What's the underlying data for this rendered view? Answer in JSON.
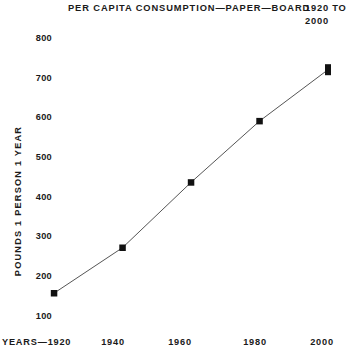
{
  "chart_data": {
    "type": "line",
    "title": "PER CAPITA CONSUMPTION—PAPER—BOARD",
    "title_range": "1920 TO 2000",
    "subtitle": "",
    "xlabel": "YEARS—1920",
    "ylabel": "POUNDS 1 PERSON 1 YEAR",
    "categories": [
      "1920",
      "1940",
      "1960",
      "1980",
      "2000"
    ],
    "x": [
      1920,
      1940,
      1960,
      1980,
      2000
    ],
    "values": [
      155,
      270,
      435,
      590,
      720
    ],
    "series": [
      {
        "name": "Per capita consumption",
        "values": [
          155,
          270,
          435,
          590,
          720
        ]
      }
    ],
    "xlim": [
      1920,
      2000
    ],
    "ylim": [
      100,
      800
    ],
    "ytick_labels": [
      "800",
      "700",
      "600",
      "500",
      "400",
      "300",
      "200",
      "100"
    ],
    "ytick_values": [
      800,
      700,
      600,
      500,
      400,
      300,
      200,
      100
    ],
    "xtick_labels": [
      "1940",
      "1960",
      "1980",
      "2000"
    ],
    "xtick_values": [
      1940,
      1960,
      1980,
      2000
    ],
    "grid": false,
    "legend": "none",
    "line_color": "#555555",
    "marker_color": "#111111",
    "marker": "square",
    "background": "#ffffff"
  },
  "chart": {
    "title_main": "PER CAPITA CONSUMPTION—PAPER—BOARD",
    "title_range_line1": "1920 TO",
    "title_range_line2": "2000",
    "y_axis_title": "POUNDS 1 PERSON 1 YEAR",
    "x_axis_first_label": "YEARS—1920",
    "y_ticks": [
      {
        "label": "800"
      },
      {
        "label": "700"
      },
      {
        "label": "600"
      },
      {
        "label": "500"
      },
      {
        "label": "400"
      },
      {
        "label": "300"
      },
      {
        "label": "200"
      },
      {
        "label": "100"
      }
    ],
    "x_ticks": [
      {
        "label": "1940"
      },
      {
        "label": "1960"
      },
      {
        "label": "1980"
      },
      {
        "label": "2000"
      }
    ]
  }
}
